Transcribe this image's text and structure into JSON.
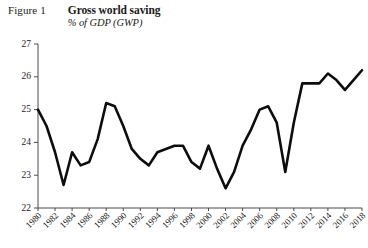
{
  "header": {
    "figure_label": "Figure 1",
    "title": "Gross world saving",
    "subtitle": "% of GDP (GWP)"
  },
  "chart_data": {
    "type": "line",
    "title": "Gross world saving",
    "subtitle": "% of GDP (GWP)",
    "xlabel": "",
    "ylabel": "% of GDP (GWP)",
    "xlim": [
      1980,
      2018
    ],
    "ylim": [
      22,
      27
    ],
    "yticks": [
      22,
      23,
      24,
      25,
      26,
      27
    ],
    "ytick_labels": [
      "22",
      "23",
      "24",
      "25",
      "26",
      "27"
    ],
    "xticks": [
      1980,
      1982,
      1984,
      1986,
      1988,
      1990,
      1992,
      1994,
      1996,
      1998,
      2000,
      2002,
      2004,
      2006,
      2008,
      2010,
      2012,
      2014,
      2016,
      2018
    ],
    "xtick_labels": [
      "1980",
      "1982",
      "1984",
      "1986",
      "1988",
      "1990",
      "1992",
      "1994",
      "1996",
      "1998",
      "2000",
      "2002",
      "2004",
      "2006",
      "2008",
      "2010",
      "2012",
      "2014",
      "2016",
      "2018"
    ],
    "xtick_rotation": 45,
    "grid": false,
    "legend": false,
    "line_color": "#0d0d0d",
    "axis_color": "#4a4a4a",
    "x": [
      1980,
      1981,
      1982,
      1983,
      1984,
      1985,
      1986,
      1987,
      1988,
      1989,
      1990,
      1991,
      1992,
      1993,
      1994,
      1995,
      1996,
      1997,
      1998,
      1999,
      2000,
      2001,
      2002,
      2003,
      2004,
      2005,
      2006,
      2007,
      2008,
      2009,
      2010,
      2011,
      2012,
      2013,
      2014,
      2015,
      2016,
      2017,
      2018
    ],
    "values": [
      25.0,
      24.5,
      23.7,
      22.7,
      23.7,
      23.3,
      23.4,
      24.1,
      25.2,
      25.1,
      24.5,
      23.8,
      23.5,
      23.3,
      23.7,
      23.8,
      23.9,
      23.9,
      23.4,
      23.2,
      23.9,
      23.2,
      22.6,
      23.1,
      23.9,
      24.4,
      25.0,
      25.1,
      24.6,
      23.1,
      24.6,
      25.8,
      25.8,
      25.8,
      26.1,
      25.9,
      25.6,
      25.9,
      26.2
    ],
    "series_name": "Gross world saving"
  }
}
